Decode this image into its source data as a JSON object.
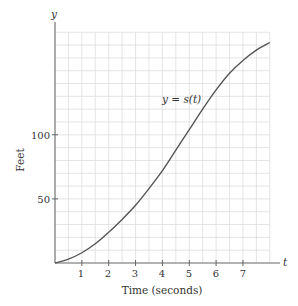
{
  "chart_data": {
    "type": "line",
    "title": "",
    "xlabel": "Time (seconds)",
    "ylabel": "Feet",
    "x_axis_name": "t",
    "y_axis_name": "y",
    "curve_label": "y = s(t)",
    "xlim": [
      0,
      8
    ],
    "ylim": [
      0,
      180
    ],
    "x_ticks": [
      1,
      2,
      3,
      4,
      5,
      6,
      7
    ],
    "y_ticks": [
      50,
      100
    ],
    "grid": true,
    "grid_x_step": 0.5,
    "grid_y_step": 10,
    "series": [
      {
        "name": "s(t)",
        "x": [
          0,
          0.5,
          1,
          1.5,
          2,
          2.5,
          3,
          3.5,
          4,
          4.5,
          5,
          5.5,
          6,
          6.5,
          7,
          7.5,
          8
        ],
        "values": [
          0,
          3,
          8,
          15,
          24,
          34,
          45,
          58,
          72,
          88,
          104,
          120,
          135,
          148,
          158,
          166,
          172
        ]
      }
    ],
    "colors": {
      "curve": "#555555",
      "axis": "#666666",
      "grid": "#dddddd"
    }
  },
  "labels": {
    "x_axis_title": "Time (seconds)",
    "y_axis_title": "Feet",
    "x_axis_var": "t",
    "y_axis_var": "y",
    "curve": "y = s(t)",
    "x_tick_1": "1",
    "x_tick_2": "2",
    "x_tick_3": "3",
    "x_tick_4": "4",
    "x_tick_5": "5",
    "x_tick_6": "6",
    "x_tick_7": "7",
    "y_tick_50": "50",
    "y_tick_100": "100"
  }
}
